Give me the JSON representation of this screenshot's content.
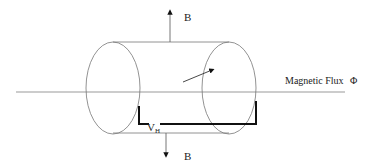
{
  "diagram": {
    "labels": {
      "b_top": "B",
      "b_bottom": "B",
      "flux": "Magnetic Flux",
      "flux_symbol": "Φ",
      "hall_voltage_main": "V",
      "hall_voltage_sub": "H"
    },
    "colors": {
      "line": "#777777",
      "bracket": "#111111",
      "text": "#222222"
    }
  }
}
